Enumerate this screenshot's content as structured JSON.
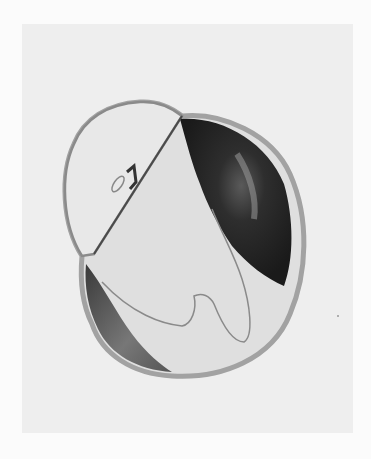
{
  "figure": {
    "colors": {
      "page_bg": "#fbfbfb",
      "plate_bg": "#eeeeee",
      "dark_tissue": "#2a2a2a",
      "mid_tissue": "#6e6e6e",
      "wall": "#c4c4c4",
      "interior": "#e6e6e6"
    }
  }
}
